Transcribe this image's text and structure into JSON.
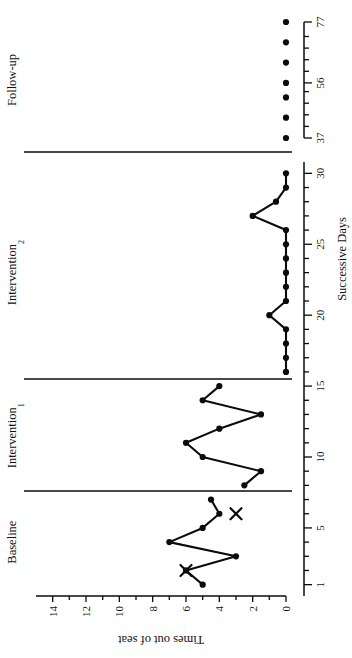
{
  "figure": {
    "y_axis_title": "Times out of seat",
    "x_axis_title": "Successive Days"
  },
  "phases": [
    {
      "id": "baseline",
      "label": "Baseline",
      "sub": "",
      "day_start": 1,
      "day_end": 7
    },
    {
      "id": "intervention1",
      "label": "Intervention",
      "sub": "1",
      "day_start": 8,
      "day_end": 15
    },
    {
      "id": "intervention2",
      "label": "Intervention",
      "sub": "2",
      "day_start": 16,
      "day_end": 30
    },
    {
      "id": "followup",
      "label": "Follow-up",
      "sub": "",
      "day_start": 37,
      "day_end": 77
    }
  ],
  "axes": {
    "y_ticks": [
      0,
      2,
      4,
      6,
      8,
      10,
      12,
      14
    ],
    "y_tick_labels": [
      "0",
      "2",
      "4",
      "6",
      "8",
      "10",
      "12",
      "14"
    ],
    "y_min": 0,
    "y_max": 15,
    "x_main_tick_labels": [
      "1",
      "5",
      "10",
      "15",
      "20",
      "25",
      "30"
    ],
    "x_main_ticks": [
      1,
      5,
      10,
      15,
      20,
      25,
      30
    ],
    "x_main_minor_every": 1,
    "x_followup_tick_labels": [
      "37",
      "56",
      "77"
    ],
    "x_followup_ticks": [
      37,
      56,
      77
    ]
  },
  "chart_data": {
    "type": "line",
    "title": "",
    "subtitle": "",
    "xlabel": "Successive Days",
    "ylabel": "Times out of seat",
    "ylim": [
      0,
      15
    ],
    "grid": false,
    "legend": "none",
    "annotations": [
      {
        "name": "x-marker-day2",
        "x": 2,
        "y": 6,
        "marker": "X"
      },
      {
        "name": "x-marker-day6",
        "x": 6,
        "y": 3,
        "marker": "X"
      }
    ],
    "series": [
      {
        "name": "Baseline",
        "phase": "baseline",
        "x": [
          1,
          2,
          3,
          4,
          5,
          6,
          7
        ],
        "values": [
          5,
          6,
          3,
          7,
          5,
          4,
          4.5
        ]
      },
      {
        "name": "Intervention 1",
        "phase": "intervention1",
        "x": [
          8,
          9,
          10,
          11,
          12,
          13,
          14,
          15
        ],
        "values": [
          2.5,
          1.5,
          5,
          6,
          4,
          1.5,
          5,
          4
        ]
      },
      {
        "name": "Intervention 2",
        "phase": "intervention2",
        "x": [
          16,
          17,
          18,
          19,
          20,
          21,
          22,
          23,
          24,
          25,
          26,
          27,
          28,
          29,
          30
        ],
        "values": [
          0,
          0,
          0,
          0,
          1,
          0,
          0,
          0,
          0,
          0,
          0,
          2,
          0.6,
          0,
          0
        ]
      },
      {
        "name": "Follow-up",
        "phase": "followup",
        "x": [
          37,
          44,
          51,
          56,
          63,
          70,
          77
        ],
        "values": [
          0,
          0,
          0,
          0,
          0,
          0,
          0
        ],
        "connected": false
      }
    ]
  },
  "colors": {
    "ink": "#0b0b0b",
    "paper": "#ffffff"
  }
}
